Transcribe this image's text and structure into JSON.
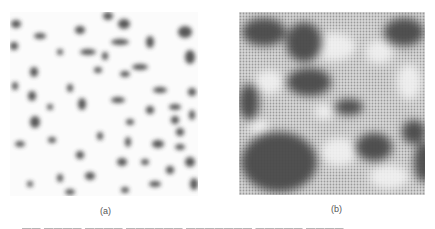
{
  "figure": {
    "panels": [
      {
        "id": "a",
        "label": "(a)",
        "description": "dispersed dark speckles on light background"
      },
      {
        "id": "b",
        "label": "(b)",
        "description": "coarsened dark domains on halftone background"
      }
    ],
    "caption_fragment": "▬▬ ▬▬▬▬ ▬▬▬▬ ▬▬▬▬▬▬ ▬▬▬▬▬▬▬ ▬▬▬▬▬ ▬▬▬▬"
  }
}
